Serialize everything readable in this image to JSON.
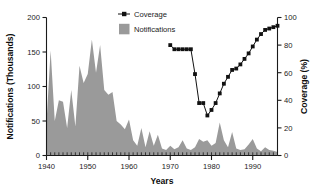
{
  "chart_data": {
    "type": "area",
    "title": "",
    "xlabel": "Years",
    "ylabel": "Notifications (Thousands)",
    "y2label": "Coverage (%)",
    "xlim": [
      1940,
      1996
    ],
    "ylim": [
      0,
      200
    ],
    "y2lim": [
      0,
      100
    ],
    "grid": false,
    "legend_position": "top-center",
    "xticks": [
      1940,
      1950,
      1960,
      1970,
      1980,
      1990
    ],
    "xticklabels": [
      "1940",
      "1950",
      "1960",
      "1970",
      "1980",
      "1990"
    ],
    "yticks": [
      0,
      50,
      100,
      150,
      200
    ],
    "yticklabels": [
      "0",
      "50",
      "100",
      "150",
      "200"
    ],
    "y2ticks": [
      0,
      20,
      40,
      60,
      80,
      100
    ],
    "y2ticklabels": [
      "0",
      "20",
      "40",
      "60",
      "80",
      "100"
    ],
    "minor_tick_interval": 1,
    "series": [
      {
        "name": "Notifications",
        "type": "area",
        "axis": "left",
        "color": "#9a9a9a",
        "x": [
          1940,
          1941,
          1942,
          1943,
          1944,
          1945,
          1946,
          1947,
          1948,
          1949,
          1950,
          1951,
          1952,
          1953,
          1954,
          1955,
          1956,
          1957,
          1958,
          1959,
          1960,
          1961,
          1962,
          1963,
          1964,
          1965,
          1966,
          1967,
          1968,
          1969,
          1970,
          1971,
          1972,
          1973,
          1974,
          1975,
          1976,
          1977,
          1978,
          1979,
          1980,
          1981,
          1982,
          1983,
          1984,
          1985,
          1986,
          1987,
          1988,
          1989,
          1990,
          1991,
          1992,
          1993,
          1994,
          1995,
          1996
        ],
        "values": [
          48,
          152,
          50,
          80,
          78,
          40,
          95,
          42,
          130,
          105,
          118,
          168,
          120,
          160,
          95,
          88,
          92,
          50,
          45,
          38,
          52,
          22,
          14,
          40,
          12,
          35,
          14,
          30,
          10,
          8,
          14,
          9,
          12,
          22,
          10,
          8,
          12,
          24,
          20,
          22,
          14,
          18,
          48,
          22,
          12,
          34,
          10,
          8,
          9,
          16,
          24,
          10,
          6,
          12,
          8,
          7,
          5
        ]
      },
      {
        "name": "Coverage",
        "type": "line",
        "axis": "right",
        "color": "#111111",
        "marker": "square",
        "x": [
          1970,
          1971,
          1972,
          1973,
          1974,
          1975,
          1976,
          1977,
          1978,
          1979,
          1980,
          1981,
          1982,
          1983,
          1984,
          1985,
          1986,
          1987,
          1988,
          1989,
          1990,
          1991,
          1992,
          1993,
          1994,
          1995,
          1996
        ],
        "values": [
          80,
          77,
          77,
          77,
          77,
          77,
          59,
          38,
          38,
          29,
          33,
          38,
          45,
          52,
          57,
          62,
          63,
          66,
          70,
          74,
          79,
          84,
          88,
          91,
          92,
          93,
          94
        ]
      }
    ]
  },
  "legend": {
    "items": [
      {
        "label": "Coverage",
        "marker": "line-square",
        "color": "#111111"
      },
      {
        "label": "Notifications",
        "marker": "filled-square",
        "color": "#9a9a9a"
      }
    ]
  },
  "axes": {
    "left_title": "Notifications (Thousands)",
    "right_title": "Coverage (%)",
    "bottom_title": "Years"
  },
  "colors": {
    "area": "#9a9a9a",
    "line": "#111111",
    "axis": "#1a1a1a",
    "background": "#ffffff"
  }
}
